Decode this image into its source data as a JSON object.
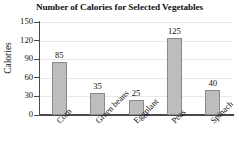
{
  "chart_data": {
    "type": "bar",
    "title": "Number of Calories for Selected Vegetables",
    "xlabel": "",
    "ylabel": "Calories",
    "categories": [
      "Corn",
      "Green beans",
      "Eggplant",
      "Peas",
      "Spinach"
    ],
    "values": [
      85,
      35,
      25,
      125,
      40
    ],
    "value_labels": [
      "85",
      "35",
      "25",
      "125",
      "40"
    ],
    "ylim": [
      0,
      150
    ],
    "yticks": [
      0,
      30,
      60,
      90,
      120,
      150
    ],
    "ytick_labels": [
      "0",
      "30",
      "60",
      "90",
      "120",
      "150"
    ],
    "grid": true,
    "legend": false,
    "bar_color": "#bdbdbd",
    "bar_border_color": "#8a8a8a",
    "axis_color": "#4a4a4a",
    "grid_color": "#e8e8e8"
  }
}
